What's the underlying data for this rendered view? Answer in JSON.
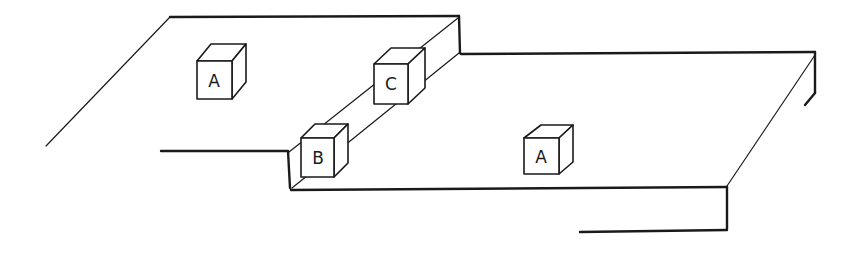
{
  "figure": {
    "type": "line drawing",
    "stroke_color": "#1a1a1a",
    "background": "#ffffff"
  },
  "blocks": [
    {
      "id": "block-a-upper",
      "label": "A",
      "location": "upper platform"
    },
    {
      "id": "block-c",
      "label": "C",
      "location": "step edge, upper"
    },
    {
      "id": "block-b",
      "label": "B",
      "location": "step edge, lower corner"
    },
    {
      "id": "block-a-lower",
      "label": "A",
      "location": "lower platform"
    }
  ]
}
